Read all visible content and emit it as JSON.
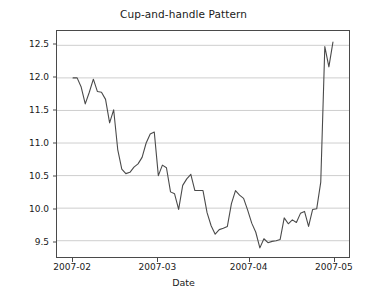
{
  "chart_data": {
    "type": "line",
    "title": "Cup-and-handle Pattern",
    "xlabel": "Date",
    "ylabel": "Price",
    "grid": "horizontal",
    "legend": "none",
    "line_color": "#4a4a4a",
    "background_color": "#ffffff",
    "ylim": [
      9.25,
      12.72
    ],
    "yticks": [
      9.5,
      10.0,
      10.5,
      11.0,
      11.5,
      12.0,
      12.5
    ],
    "ytick_labels": [
      "9.5",
      "10.0",
      "10.5",
      "11.0",
      "11.5",
      "12.0",
      "12.5"
    ],
    "xlim": [
      "2007-01-29",
      "2007-05-07"
    ],
    "xticks": [
      "2007-02",
      "2007-03",
      "2007-04",
      "2007-05"
    ],
    "xtick_labels": [
      "2007-02",
      "2007-03",
      "2007-04",
      "2007-05"
    ],
    "xtick_positions_frac": [
      0.055,
      0.345,
      0.655,
      0.945
    ],
    "series": [
      {
        "name": "Price",
        "x": [
          "2007-02-01",
          "2007-02-02",
          "2007-02-05",
          "2007-02-06",
          "2007-02-07",
          "2007-02-08",
          "2007-02-09",
          "2007-02-12",
          "2007-02-13",
          "2007-02-14",
          "2007-02-15",
          "2007-02-16",
          "2007-02-19",
          "2007-02-20",
          "2007-02-21",
          "2007-02-22",
          "2007-02-23",
          "2007-02-26",
          "2007-02-27",
          "2007-02-28",
          "2007-03-01",
          "2007-03-02",
          "2007-03-05",
          "2007-03-06",
          "2007-03-07",
          "2007-03-08",
          "2007-03-09",
          "2007-03-12",
          "2007-03-13",
          "2007-03-14",
          "2007-03-15",
          "2007-03-16",
          "2007-03-19",
          "2007-03-20",
          "2007-03-21",
          "2007-03-22",
          "2007-03-23",
          "2007-03-26",
          "2007-03-27",
          "2007-03-28",
          "2007-03-29",
          "2007-03-30",
          "2007-04-02",
          "2007-04-03",
          "2007-04-04",
          "2007-04-05",
          "2007-04-06",
          "2007-04-09",
          "2007-04-10",
          "2007-04-11",
          "2007-04-12",
          "2007-04-13",
          "2007-04-16",
          "2007-04-17",
          "2007-04-18",
          "2007-04-19",
          "2007-04-20",
          "2007-04-23",
          "2007-04-24",
          "2007-04-25",
          "2007-04-26",
          "2007-04-27",
          "2007-04-30",
          "2007-05-01",
          "2007-05-02"
        ],
        "values": [
          12.0,
          12.0,
          11.86,
          11.6,
          11.78,
          11.98,
          11.79,
          11.78,
          11.67,
          11.31,
          11.51,
          10.9,
          10.6,
          10.53,
          10.55,
          10.63,
          10.68,
          10.78,
          11.0,
          11.14,
          11.17,
          10.5,
          10.66,
          10.62,
          10.25,
          10.22,
          9.98,
          10.35,
          10.45,
          10.52,
          10.27,
          10.27,
          10.27,
          9.93,
          9.73,
          9.6,
          9.67,
          9.69,
          9.72,
          10.07,
          10.27,
          10.2,
          10.15,
          9.97,
          9.77,
          9.63,
          9.39,
          9.53,
          9.47,
          9.49,
          9.5,
          9.52,
          9.85,
          9.76,
          9.82,
          9.78,
          9.92,
          9.95,
          9.72,
          9.98,
          9.99,
          10.4,
          12.48,
          12.17,
          12.55
        ]
      }
    ]
  },
  "figure": {
    "title": "Cup-and-handle Pattern",
    "xaxis_label": "Date",
    "yaxis_label": "Price"
  }
}
